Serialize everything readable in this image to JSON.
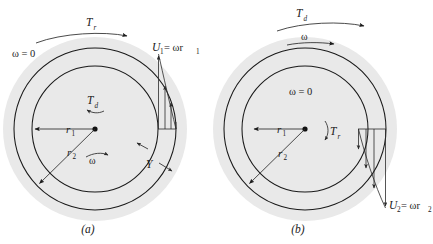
{
  "figure": {
    "caption_a": "(a)",
    "caption_b": "(b)",
    "background_color": "#ffffff",
    "fluid_fill_color": "#e9e9e9",
    "line_color": "#1a1a1a"
  },
  "panel_a": {
    "name": "rotating-outer-cylinder",
    "torque_applied_label": "T",
    "torque_applied_sub": "r",
    "torque_drag_label": "T",
    "torque_drag_sub": "d",
    "omega_zero_label": "ω = 0",
    "omega_label": "ω",
    "r1_label": "r",
    "r1_sub": "1",
    "r2_label": "r",
    "r2_sub": "2",
    "gap_label": "Y",
    "velocity_label_main": "U",
    "velocity_label_sub": "1",
    "velocity_label_eq": " = ωr",
    "velocity_label_eq_sub": "1",
    "velocity_profile_direction": "up",
    "center": {
      "x": 95,
      "y": 129
    },
    "radius_inner": 63,
    "radius_outer": 81,
    "radius_fluid": 92
  },
  "panel_b": {
    "name": "rotating-inner-cylinder",
    "torque_drag_label": "T",
    "torque_drag_sub": "d",
    "torque_applied_label": "T",
    "torque_applied_sub": "r",
    "omega_top_label": "ω",
    "omega_zero_label": "ω = 0",
    "r1_label": "r",
    "r1_sub": "1",
    "r2_label": "r",
    "r2_sub": "2",
    "velocity_label_main": "U",
    "velocity_label_sub": "2",
    "velocity_label_eq": " = ωr",
    "velocity_label_eq_sub": "2",
    "velocity_profile_direction": "down",
    "center": {
      "x": 305,
      "y": 129
    },
    "radius_inner": 63,
    "radius_outer": 81,
    "radius_fluid": 92
  }
}
